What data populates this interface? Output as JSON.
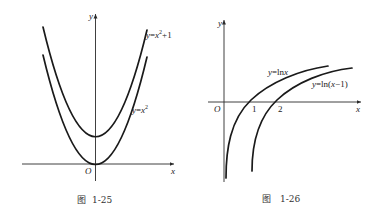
{
  "figures": [
    {
      "id": "fig-1-25",
      "caption_prefix": "图",
      "caption_number": "1-25",
      "axes": {
        "x_label": "x",
        "y_label": "y",
        "origin_label": "O"
      },
      "curves": [
        {
          "name": "y=x^2+1",
          "label": "y=x²+1"
        },
        {
          "name": "y=x^2",
          "label": "y=x²"
        }
      ]
    },
    {
      "id": "fig-1-26",
      "caption_prefix": "图",
      "caption_number": "1-26",
      "axes": {
        "x_label": "x",
        "y_label": "y",
        "origin_label": "O"
      },
      "ticks": [
        "1",
        "2"
      ],
      "curves": [
        {
          "name": "y=ln x",
          "label": "y=lnx"
        },
        {
          "name": "y=ln(x-1)",
          "label": "y=ln(x−1)"
        }
      ]
    }
  ],
  "colors": {
    "ink": "#1a1a1a",
    "background": "#ffffff"
  }
}
